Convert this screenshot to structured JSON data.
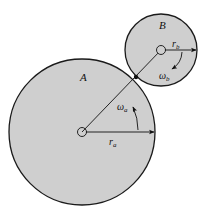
{
  "diagram": {
    "type": "gear-contact",
    "colors": {
      "fill": "#cfcfcf",
      "stroke": "#1a1a1a",
      "background": "#ffffff"
    },
    "gear_a": {
      "label": "A",
      "radius_label": "r",
      "radius_sub": "a",
      "omega_label": "ω",
      "omega_sub": "a",
      "rotation": "counterclockwise"
    },
    "gear_b": {
      "label": "B",
      "radius_label": "r",
      "radius_sub": "b",
      "omega_label": "ω",
      "omega_sub": "b",
      "rotation": "clockwise"
    },
    "contact_point": "point of tangency between A and B"
  }
}
